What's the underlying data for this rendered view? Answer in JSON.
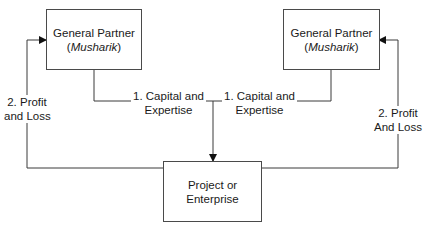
{
  "diagram": {
    "nodes": {
      "left_partner": {
        "title": "General Partner",
        "paren_open": "(",
        "subtitle": "Musharik",
        "paren_close": ")"
      },
      "right_partner": {
        "title": "General Partner",
        "paren_open": "(",
        "subtitle": "Musharik",
        "paren_close": ")"
      },
      "project": {
        "line1": "Project or",
        "line2": "Enterprise"
      }
    },
    "edges": {
      "left_capital": {
        "line1": "1. Capital and",
        "line2": "Expertise"
      },
      "right_capital": {
        "line1": "1. Capital and",
        "line2": "Expertise"
      },
      "left_profit": {
        "line1": "2. Profit",
        "line2": "and Loss"
      },
      "right_profit": {
        "line1": "2. Profit",
        "line2": "And Loss"
      }
    },
    "colors": {
      "line": "#3a3a3a",
      "box_border": "#4a4a4a",
      "text": "#1a1a1a"
    }
  }
}
